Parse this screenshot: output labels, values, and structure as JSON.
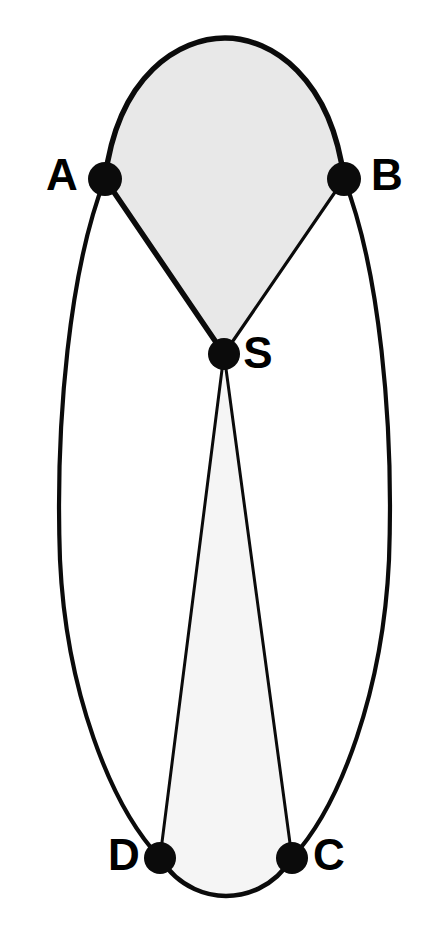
{
  "figure": {
    "kind": "graph-diagram",
    "title": "",
    "background_color": "#ffffff",
    "width": 423,
    "height": 932
  },
  "colors": {
    "node": "#0b0b0b",
    "edge": "#0b0b0b",
    "label": "#000000",
    "upper_region_fill": "#e8e8e8",
    "lower_region_fill": "#f5f5f5",
    "background": "#ffffff"
  },
  "nodes": [
    {
      "id": "A",
      "label": "A",
      "cx": 105,
      "cy": 179,
      "r": 17,
      "label_x": 62,
      "label_y": 178,
      "label_anchor": "middle"
    },
    {
      "id": "B",
      "label": "B",
      "cx": 344,
      "cy": 179,
      "r": 17,
      "label_x": 387,
      "label_y": 178,
      "label_anchor": "middle"
    },
    {
      "id": "S",
      "label": "S",
      "cx": 224,
      "cy": 354,
      "r": 16,
      "label_x": 258,
      "label_y": 356,
      "label_anchor": "middle"
    },
    {
      "id": "D",
      "label": "D",
      "cx": 160,
      "cy": 858,
      "r": 16,
      "label_x": 124,
      "label_y": 858,
      "label_anchor": "middle"
    },
    {
      "id": "C",
      "label": "C",
      "cx": 292,
      "cy": 858,
      "r": 16,
      "label_x": 329,
      "label_y": 858,
      "label_anchor": "middle"
    }
  ],
  "edges": [
    {
      "id": "edge-A-B-top",
      "from": "A",
      "to": "B",
      "style": "arc-top",
      "stroke_width": 5.5,
      "path": "M 105 179 C 118 74, 180 38, 225 38 C 272 38, 331 78, 344 179"
    },
    {
      "id": "edge-A-S",
      "from": "A",
      "to": "S",
      "style": "straight",
      "stroke_width": 5.5,
      "path": "M 105 179 L 224 354"
    },
    {
      "id": "edge-B-S",
      "from": "B",
      "to": "S",
      "style": "straight",
      "stroke_width": 3.2,
      "path": "M 344 179 L 224 354"
    },
    {
      "id": "edge-A-D-outer",
      "from": "A",
      "to": "D",
      "style": "arc-left",
      "stroke_width": 4.2,
      "path": "M 105 179 C 70 268, 55 420, 60 560 C 66 690, 110 805, 160 858"
    },
    {
      "id": "edge-B-C-outer",
      "from": "B",
      "to": "C",
      "style": "arc-right",
      "stroke_width": 4.2,
      "path": "M 344 179 C 379 268, 394 420, 389 560 C 383 690, 341 805, 292 858"
    },
    {
      "id": "edge-S-D",
      "from": "S",
      "to": "D",
      "style": "straight-thin",
      "stroke_width": 3.0,
      "path": "M 224 354 L 160 858"
    },
    {
      "id": "edge-S-C",
      "from": "S",
      "to": "C",
      "style": "straight-thin",
      "stroke_width": 3.0,
      "path": "M 224 354 L 292 858"
    },
    {
      "id": "edge-D-C-bottom",
      "from": "D",
      "to": "C",
      "style": "arc-bottom",
      "stroke_width": 4.6,
      "path": "M 160 858 C 180 890, 210 896, 226 896 C 244 896, 273 889, 292 858"
    }
  ],
  "regions": [
    {
      "id": "upper-region",
      "name": "region-A-B-S",
      "fill": "#e8e8e8",
      "bounded_by": [
        "edge-A-B-top",
        "edge-A-S",
        "edge-B-S"
      ],
      "path": "M 105 179 C 118 74, 180 38, 225 38 C 272 38, 331 78, 344 179 L 224 354 Z"
    },
    {
      "id": "lower-region",
      "name": "region-S-D-C",
      "fill": "#f5f5f5",
      "bounded_by": [
        "edge-S-D",
        "edge-S-C",
        "edge-D-C-bottom"
      ],
      "path": "M 224 354 L 160 858 C 180 890, 210 896, 226 896 C 244 896, 273 889, 292 858 Z"
    }
  ],
  "labels": {
    "A": "A",
    "B": "B",
    "S": "S",
    "C": "C",
    "D": "D"
  }
}
